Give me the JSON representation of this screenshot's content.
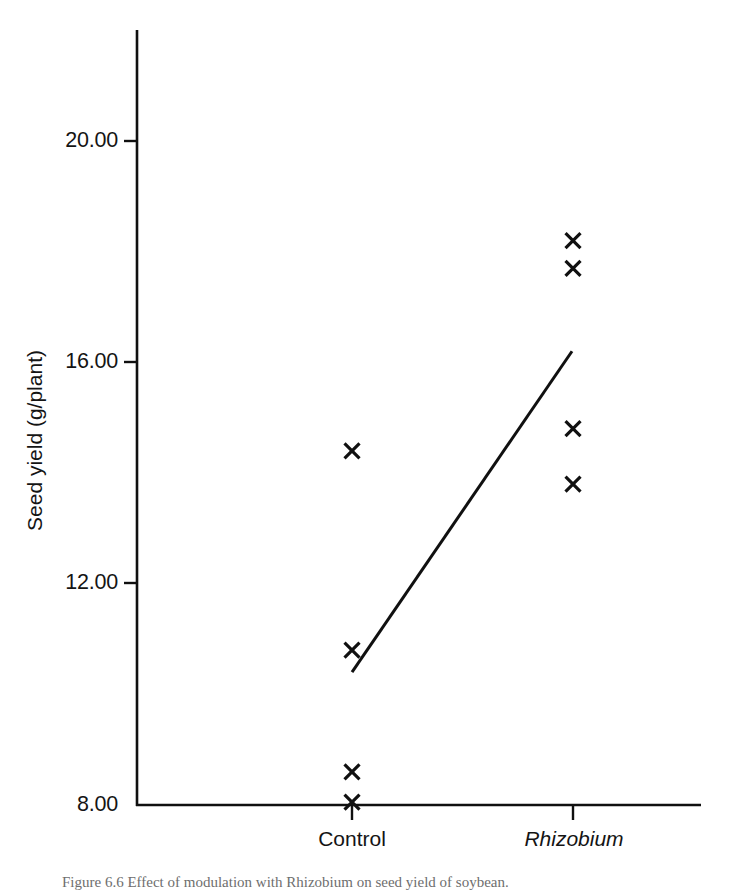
{
  "figure": {
    "caption_prefix": "Figure 6.6",
    "caption_text": "Effect of modulation with Rhizobium on seed yield of soybean."
  },
  "chart_data": {
    "type": "scatter",
    "title": "",
    "xlabel": "",
    "ylabel": "Seed yield (g/plant)",
    "categories": [
      "Control",
      "Rhizobium"
    ],
    "category_styles": [
      "normal",
      "italic"
    ],
    "x_positions": [
      1,
      2
    ],
    "xlim": [
      0.35,
      2.58
    ],
    "ylim": [
      8.0,
      22.0
    ],
    "yticks": [
      8.0,
      12.0,
      16.0,
      20.0
    ],
    "ytick_labels": [
      "8.00",
      "12.00",
      "16.00",
      "20.00"
    ],
    "grid": false,
    "legend": false,
    "marker": "x",
    "marker_color": "#101010",
    "series": [
      {
        "name": "Control",
        "x": [
          1,
          1,
          1,
          1
        ],
        "values": [
          14.4,
          10.8,
          8.6,
          8.05
        ]
      },
      {
        "name": "Rhizobium",
        "x": [
          2,
          2,
          2,
          2
        ],
        "values": [
          18.2,
          17.7,
          14.8,
          13.8
        ]
      }
    ],
    "trendline": {
      "name": "regression-line",
      "x": [
        1,
        2
      ],
      "values": [
        10.4,
        16.2
      ],
      "color": "#101010"
    },
    "axis_color": "#101010",
    "background": "#ffffff"
  }
}
